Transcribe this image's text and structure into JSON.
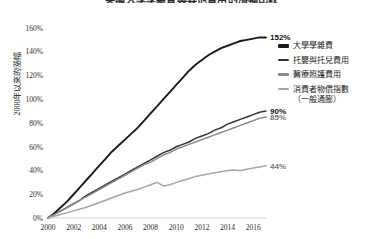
{
  "chart_title": "美國大學學雜費與其他費用的漲幅比較",
  "legend": {
    "items": [
      {
        "label": "大學學雜費",
        "color": "#1b1b1b",
        "width": 2.0
      },
      {
        "label": "托嬰與托兒費用",
        "color": "#333333",
        "width": 1.8
      },
      {
        "label": "醫療照護費用",
        "color": "#8a8a8a",
        "width": 1.6
      },
      {
        "label": "消費者物價指數",
        "sublabel": "（一般通膨）",
        "color": "#a6a6a6",
        "width": 1.6
      }
    ]
  },
  "chart_data": {
    "type": "line",
    "title": "美國大學學雜費與其他費用的漲幅比較",
    "xlabel": "",
    "ylabel": "2000年以來的漲幅",
    "xlim": [
      2000,
      2017
    ],
    "ylim": [
      0,
      165
    ],
    "grid": false,
    "legend_position": "right",
    "xticks": [
      "2000",
      "2002",
      "2004",
      "2006",
      "2008",
      "2010",
      "2012",
      "2014",
      "2016"
    ],
    "xtick_values": [
      2000,
      2002,
      2004,
      2006,
      2008,
      2010,
      2012,
      2014,
      2016
    ],
    "yticks": [
      "0%",
      "20%",
      "40%",
      "60%",
      "80%",
      "100%",
      "120%",
      "140%",
      "160%"
    ],
    "ytick_values": [
      0,
      20,
      40,
      60,
      80,
      100,
      120,
      140,
      160
    ],
    "x": [
      2000,
      2000.5,
      2001,
      2001.5,
      2002,
      2002.5,
      2003,
      2003.5,
      2004,
      2004.5,
      2005,
      2005.5,
      2006,
      2006.5,
      2007,
      2007.5,
      2008,
      2008.5,
      2009,
      2009.5,
      2010,
      2010.5,
      2011,
      2011.5,
      2012,
      2012.5,
      2013,
      2013.5,
      2014,
      2014.5,
      2015,
      2015.5,
      2016,
      2016.5,
      2017
    ],
    "series": [
      {
        "name": "大學學雜費",
        "color": "#1b1b1b",
        "end_label": "152%",
        "end_value": 152,
        "values": [
          0,
          4,
          9,
          14,
          20,
          26,
          32,
          38,
          44,
          50,
          56,
          61,
          66,
          71,
          76,
          82,
          88,
          94,
          100,
          106,
          112,
          118,
          124,
          129,
          133,
          137,
          140,
          143,
          145,
          147,
          149,
          150,
          151,
          152,
          152
        ]
      },
      {
        "name": "托嬰與托兒費用",
        "color": "#333333",
        "end_label": "90%",
        "end_value": 90,
        "values": [
          0,
          3,
          6,
          9,
          12,
          15,
          19,
          22,
          25,
          28,
          31,
          34,
          37,
          40,
          43,
          46,
          49,
          52,
          55,
          57,
          60,
          62,
          64,
          67,
          69,
          71,
          74,
          76,
          79,
          81,
          83,
          85,
          87,
          89,
          90
        ]
      },
      {
        "name": "醫療照護費用",
        "color": "#8a8a8a",
        "end_label": "85%",
        "end_value": 85,
        "values": [
          0,
          3,
          6,
          9,
          12,
          15,
          18,
          21,
          24,
          27,
          30,
          33,
          36,
          39,
          42,
          45,
          47,
          50,
          53,
          55,
          58,
          60,
          62,
          64,
          66,
          68,
          70,
          72,
          74,
          76,
          78,
          80,
          82,
          84,
          85
        ]
      },
      {
        "name": "消費者物價指數（一般通膨）",
        "color": "#a6a6a6",
        "end_label": "44%",
        "end_value": 44,
        "values": [
          0,
          1.5,
          3,
          4.5,
          6,
          7.5,
          9,
          11,
          13,
          15,
          17,
          19,
          21,
          22.5,
          24,
          26,
          28,
          30,
          27,
          28,
          30,
          31.5,
          33,
          35,
          36,
          37,
          38,
          39,
          40,
          40.5,
          40,
          41,
          42,
          43,
          44
        ]
      }
    ]
  }
}
